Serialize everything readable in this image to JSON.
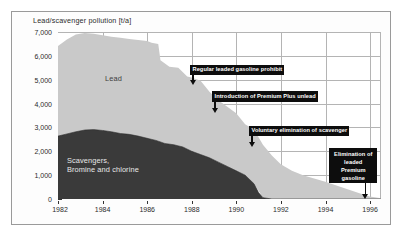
{
  "chart_data": {
    "type": "area",
    "title": "Lead/scavenger pollution [t/a]",
    "xlabel": "",
    "ylabel": "",
    "stacked": true,
    "grid": true,
    "legend_position": "inline-labels",
    "xlim": [
      1982,
      1996.5
    ],
    "ylim": [
      0,
      7700
    ],
    "ytick_labels": [
      "0",
      "1,000",
      "2,000",
      "3,000",
      "4,000",
      "5,000",
      "6,000",
      "7,000"
    ],
    "ytick_values": [
      0,
      1000,
      2000,
      3000,
      4000,
      5000,
      6000,
      7000
    ],
    "xtick_labels": [
      "1982",
      "1984",
      "1986",
      "1988",
      "1990",
      "1992",
      "1994",
      "1996"
    ],
    "xtick_values": [
      1982,
      1984,
      1986,
      1988,
      1990,
      1992,
      1994,
      1996
    ],
    "series": [
      {
        "name": "Scavengers, Bromine and chlorine",
        "color": "#3a3a3a",
        "x": [
          1982,
          1982.4,
          1982.8,
          1983.2,
          1983.6,
          1984,
          1984.4,
          1984.8,
          1985.2,
          1985.6,
          1986,
          1986.4,
          1986.8,
          1987.2,
          1987.6,
          1988,
          1988.4,
          1988.8,
          1989.2,
          1989.6,
          1990,
          1990.4,
          1990.8,
          1991,
          1991.2,
          1991.6,
          1992,
          1996.5
        ],
        "values": [
          2900,
          3000,
          3100,
          3180,
          3200,
          3160,
          3100,
          3020,
          2980,
          2900,
          2800,
          2700,
          2560,
          2500,
          2400,
          2200,
          2050,
          1900,
          1700,
          1500,
          1300,
          1100,
          700,
          300,
          60,
          0,
          0,
          0
        ]
      },
      {
        "name": "Lead",
        "color": "#c9c9c9",
        "x": [
          1982,
          1982.4,
          1982.8,
          1983.2,
          1983.6,
          1984,
          1984.4,
          1984.8,
          1985.2,
          1985.6,
          1986,
          1986.2,
          1986.5,
          1986.6,
          1987,
          1987.4,
          1987.8,
          1988,
          1988.4,
          1988.8,
          1989.2,
          1989.6,
          1990,
          1990.4,
          1990.8,
          1991.2,
          1991.6,
          1992,
          1992.5,
          1993,
          1993.5,
          1994,
          1994.5,
          1995,
          1995.5,
          1996,
          1996.5
        ],
        "values": [
          7050,
          7350,
          7580,
          7650,
          7620,
          7550,
          7480,
          7430,
          7380,
          7330,
          7280,
          7200,
          7150,
          6400,
          6100,
          6050,
          5650,
          5600,
          5450,
          4950,
          4550,
          4250,
          3950,
          3450,
          3200,
          2500,
          2000,
          1600,
          1300,
          1100,
          950,
          800,
          620,
          450,
          280,
          120,
          30
        ]
      }
    ],
    "inline_labels": [
      {
        "text": "Lead",
        "series": "Lead"
      },
      {
        "text": "Scavengers,",
        "series": "Scavengers"
      },
      {
        "text": "Bromine and chlorine",
        "series": "Scavengers"
      }
    ],
    "annotations": [
      {
        "id": "a1",
        "text": "Regular leaded gasoline prohibit",
        "target_year": 1988,
        "target_value": 5050
      },
      {
        "id": "a2",
        "text": "Introduction of Premium Plus unlead",
        "target_year": 1989,
        "target_value": 3800
      },
      {
        "id": "a3",
        "text": "Voluntary elimination of scavenger",
        "target_year": 1991,
        "target_value": 2100
      },
      {
        "id": "a4",
        "line1": "Elimination of",
        "line2": "leaded Premium",
        "line3": "gasoline",
        "target_year": 1996.3,
        "target_value": 100
      }
    ]
  },
  "colors": {
    "lead_fill": "#c9c9c9",
    "scavenger_fill": "#3a3a3a",
    "grid": "#b4b4b4",
    "axis": "#111111",
    "callout_bg": "#0d0d0d",
    "callout_text": "#ffffff",
    "frame": "#9a9a9a"
  }
}
